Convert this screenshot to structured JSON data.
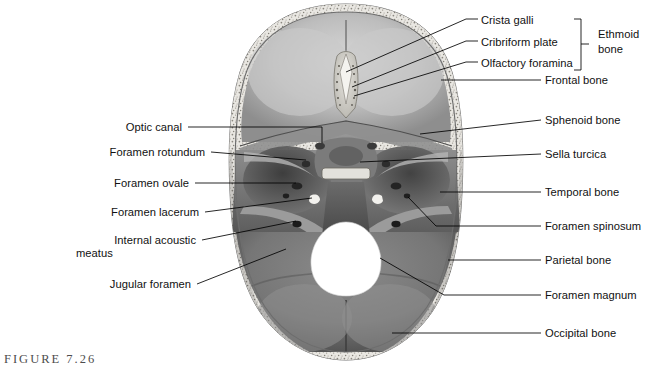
{
  "figure": {
    "caption": "FIGURE 7.26",
    "background_color": "#ffffff",
    "leader_line_color": "#000000",
    "label_text_color": "#111111",
    "caption_color": "#4d4d4d"
  },
  "labels": {
    "right_top": [
      {
        "text": "Crista galli",
        "x": 481,
        "y": 22
      },
      {
        "text": "Cribriform plate",
        "x": 481,
        "y": 44
      },
      {
        "text": "Olfactory foramina",
        "x": 481,
        "y": 65
      }
    ],
    "right_main": [
      {
        "text": "Frontal bone",
        "x": 545,
        "y": 83
      },
      {
        "text": "Sphenoid bone",
        "x": 545,
        "y": 123
      },
      {
        "text": "Sella turcica",
        "x": 545,
        "y": 157
      },
      {
        "text": "Temporal bone",
        "x": 545,
        "y": 195
      },
      {
        "text": "Foramen spinosum",
        "x": 545,
        "y": 229
      },
      {
        "text": "Parietal bone",
        "x": 545,
        "y": 263
      },
      {
        "text": "Foramen magnum",
        "x": 545,
        "y": 298
      },
      {
        "text": "Occipital bone",
        "x": 545,
        "y": 336
      }
    ],
    "left": [
      {
        "text": "Optic canal",
        "x": 182,
        "y": 130,
        "lines": 1
      },
      {
        "text": "Foramen rotundum",
        "x": 205,
        "y": 155,
        "lines": 1
      },
      {
        "text": "Foramen ovale",
        "x": 189,
        "y": 186,
        "lines": 1
      },
      {
        "text": "Foramen lacerum",
        "x": 199,
        "y": 215,
        "lines": 1
      },
      {
        "text": "Internal acoustic",
        "x": 196,
        "y": 243,
        "lines": 1
      },
      {
        "text": "meatus",
        "x": 146,
        "y": 256,
        "lines": 1
      },
      {
        "text": "Jugular foramen",
        "x": 191,
        "y": 287,
        "lines": 1
      }
    ]
  },
  "bracket": {
    "label_line_1": "Ethmoid",
    "label_line_2": "bone",
    "label_x": 600,
    "label_y_1": 36,
    "label_y_2": 51,
    "x": 581,
    "y_top": 19,
    "y_bottom": 70,
    "tick_x": 589,
    "tick_y": 44
  },
  "colors": {
    "bone_light": "#cfcfcf",
    "bone_mid": "#a8a8a8",
    "bone_dark": "#6e6e6e",
    "bone_shadow": "#3c3c3c",
    "diploe": "#e8e6e2",
    "foramen_magnum": "#ffffff",
    "outline": "#5a5a5a"
  }
}
